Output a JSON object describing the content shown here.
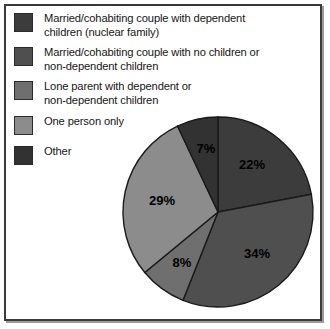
{
  "chart_data": {
    "type": "pie",
    "title": "",
    "categories": [
      "Married/cohabiting couple with dependent children (nuclear family)",
      "Married/cohabiting couple with no children or non-dependent children",
      "Lone parent with dependent or non-dependent children",
      "One person only",
      "Other"
    ],
    "values": [
      22,
      34,
      8,
      29,
      7
    ],
    "value_labels": [
      "22%",
      "34%",
      "8%",
      "29%",
      "7%"
    ],
    "unit": "percent",
    "start_angle_deg": 0,
    "direction": "clockwise",
    "legend_position": "top-left",
    "grid": false,
    "colors": [
      "#3c3c3c",
      "#4f4f4f",
      "#6f6f6f",
      "#8c8c8c",
      "#323232"
    ]
  },
  "legend": {
    "items": [
      {
        "label": "Married/cohabiting couple with dependent\nchildren (nuclear family)",
        "color": "#3c3c3c",
        "value_label": "22%"
      },
      {
        "label": "Married/cohabiting couple with no children or\nnon-dependent children",
        "color": "#4f4f4f",
        "value_label": "34%"
      },
      {
        "label": "Lone parent with dependent or\nnon-dependent children",
        "color": "#6f6f6f",
        "value_label": "8%"
      },
      {
        "label": "One person only",
        "color": "#8c8c8c",
        "value_label": "29%"
      },
      {
        "label": "Other",
        "color": "#323232",
        "value_label": "7%"
      }
    ]
  },
  "pie": {
    "center_x": 218,
    "center_y": 212,
    "radius": 95,
    "outline_color": "#1a1a1a",
    "slices": [
      {
        "name": "nuclear-family",
        "label": "22%",
        "value": 22,
        "color": "#3c3c3c",
        "label_x": 252,
        "label_y": 169
      },
      {
        "name": "couple-no-dependent-children",
        "label": "34%",
        "value": 34,
        "color": "#4f4f4f",
        "label_x": 257,
        "label_y": 258
      },
      {
        "name": "lone-parent",
        "label": "8%",
        "value": 8,
        "color": "#6f6f6f",
        "label_x": 182,
        "label_y": 267
      },
      {
        "name": "one-person-only",
        "label": "29%",
        "value": 29,
        "color": "#8c8c8c",
        "label_x": 162,
        "label_y": 205
      },
      {
        "name": "other",
        "label": "7%",
        "value": 7,
        "color": "#323232",
        "label_x": 206,
        "label_y": 153
      }
    ]
  }
}
